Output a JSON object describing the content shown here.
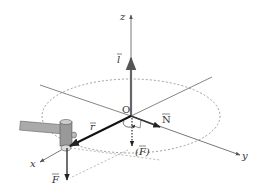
{
  "diagram": {
    "labels": {
      "z_axis": "z",
      "x_axis": "x",
      "y_axis": "y",
      "origin": "O",
      "angular_momentum": "l",
      "position_vector": "r",
      "normal_force": "N",
      "force": "F",
      "force_projected": "(F)",
      "force_projected_open": "(",
      "force_projected_close": ")"
    },
    "colors": {
      "axis": "#555555",
      "vector": "#222222",
      "dashed": "#888888",
      "hammer_body": "#999999",
      "hammer_light": "#cccccc"
    }
  }
}
